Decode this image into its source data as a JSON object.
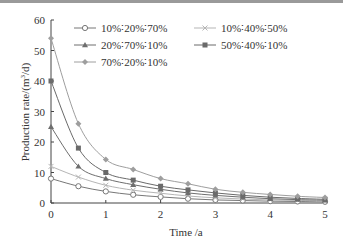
{
  "chart_data": {
    "type": "line",
    "title": "",
    "xlabel": "Time /a",
    "ylabel": "Production rate/(m³/d)",
    "ylabel_parts": {
      "prefix": "Production rate/(m",
      "sup": "3",
      "suffix": "/d)"
    },
    "xlim": [
      0,
      5
    ],
    "ylim": [
      0,
      60
    ],
    "xticks": [
      0,
      1,
      2,
      3,
      4,
      5
    ],
    "yticks": [
      0,
      10,
      20,
      30,
      40,
      50,
      60
    ],
    "grid": false,
    "legend_position": "upper right, inside",
    "x": [
      0,
      0.5,
      1,
      1.5,
      2,
      2.5,
      3,
      3.5,
      4,
      4.5,
      5
    ],
    "series": [
      {
        "name": "10%∶20%∶70%",
        "marker": "open-circle",
        "color": "#777777",
        "values": [
          8,
          5.5,
          3.8,
          2.7,
          2.0,
          1.4,
          1.0,
          0.8,
          0.6,
          0.5,
          0.4
        ]
      },
      {
        "name": "10%∶40%∶50%",
        "marker": "x",
        "color": "#b5b5b5",
        "values": [
          12,
          8.5,
          5.8,
          4.2,
          3.2,
          2.3,
          1.7,
          1.3,
          1.0,
          0.8,
          0.6
        ]
      },
      {
        "name": "20%∶70%∶10%",
        "marker": "triangle",
        "color": "#6e6e6e",
        "values": [
          25,
          12,
          8,
          6,
          4.5,
          3.3,
          2.5,
          1.9,
          1.4,
          1.1,
          0.9
        ]
      },
      {
        "name": "50%∶40%∶10%",
        "marker": "square",
        "color": "#6a6a6a",
        "values": [
          40,
          18,
          10,
          7.5,
          5.5,
          4.3,
          3.3,
          2.5,
          1.9,
          1.5,
          1.2
        ]
      },
      {
        "name": "70%∶20%∶10%",
        "marker": "diamond",
        "color": "#9e9e9e",
        "values": [
          54,
          26,
          14.3,
          11,
          8,
          6.3,
          4.5,
          3.5,
          2.8,
          2.2,
          1.8
        ]
      }
    ]
  }
}
